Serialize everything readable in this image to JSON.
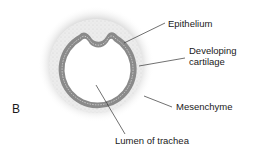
{
  "figure": {
    "panel_letter": "B",
    "labels": {
      "epithelium": "Epithelium",
      "cartilage_line1": "Developing",
      "cartilage_line2": "cartilage",
      "mesenchyme": "Mesenchyme",
      "lumen": "Lumen of trachea"
    },
    "colors": {
      "mesenchyme_halo": "#cfcfcf",
      "cartilage_fill": "#e9e9e9",
      "epithelium_band": "#8a8a8a",
      "lumen": "#ffffff",
      "leader_lines": "#333333"
    }
  }
}
